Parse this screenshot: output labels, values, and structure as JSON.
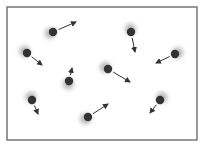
{
  "diagram": {
    "box": {
      "x": 7,
      "y": 7,
      "width": 190,
      "height": 133,
      "stroke": "#777777"
    },
    "colors": {
      "particle": "#333333",
      "blur": "#999999",
      "arrow": "#333333"
    },
    "particles": [
      {
        "x": 53,
        "y": 32,
        "dx": 23,
        "dy": -10
      },
      {
        "x": 27,
        "y": 53,
        "dx": 15,
        "dy": 12
      },
      {
        "x": 131,
        "y": 32,
        "dx": 4,
        "dy": 20
      },
      {
        "x": 175,
        "y": 54,
        "dx": -19,
        "dy": 9
      },
      {
        "x": 69,
        "y": 81,
        "dx": 3,
        "dy": -13
      },
      {
        "x": 108,
        "y": 69,
        "dx": 22,
        "dy": 13
      },
      {
        "x": 32,
        "y": 100,
        "dx": 6,
        "dy": 14
      },
      {
        "x": 88,
        "y": 117,
        "dx": 20,
        "dy": -13
      },
      {
        "x": 160,
        "y": 100,
        "dx": -10,
        "dy": 13
      }
    ]
  }
}
